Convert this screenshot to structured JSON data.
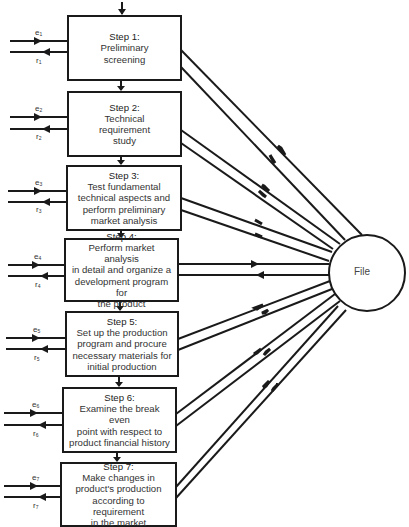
{
  "diagram": {
    "type": "flow-process",
    "central_node": {
      "label": "File"
    },
    "steps": [
      {
        "title": "Step 1:",
        "lines": [
          "Preliminary",
          "screening"
        ],
        "input": "e1",
        "output": "r1"
      },
      {
        "title": "Step 2:",
        "lines": [
          "Technical",
          "requirement",
          "study"
        ],
        "input": "e2",
        "output": "r2"
      },
      {
        "title": "Step 3:",
        "lines": [
          "Test fundamental",
          "technical aspects and",
          "perform preliminary",
          "market analysis"
        ],
        "input": "e3",
        "output": "r3"
      },
      {
        "title": "Step 4:",
        "lines": [
          "Perform market analysis",
          "in detail and organize a",
          "development program for",
          "the product"
        ],
        "input": "e4",
        "output": "r4"
      },
      {
        "title": "Step 5:",
        "lines": [
          "Set up the production",
          "program and procure",
          "necessary materials for",
          "initial production"
        ],
        "input": "e5",
        "output": "r5"
      },
      {
        "title": "Step 6:",
        "lines": [
          "Examine the break even",
          "point with respect to",
          "product financial history"
        ],
        "input": "e6",
        "output": "r6"
      },
      {
        "title": "Step 7:",
        "lines": [
          "Make changes in",
          "product's production",
          "according to requirement",
          "in the market"
        ],
        "input": "e7",
        "output": "r7"
      }
    ],
    "labels": {
      "e": [
        "e",
        "e",
        "e",
        "e",
        "e",
        "e",
        "e"
      ],
      "r": [
        "r",
        "r",
        "r",
        "r",
        "r",
        "r",
        "r"
      ],
      "subs": [
        "1",
        "2",
        "3",
        "4",
        "5",
        "6",
        "7"
      ]
    },
    "colors": {
      "line": "#1a1a1a",
      "background": "#ffffff",
      "text": "#2a2a2a"
    }
  }
}
